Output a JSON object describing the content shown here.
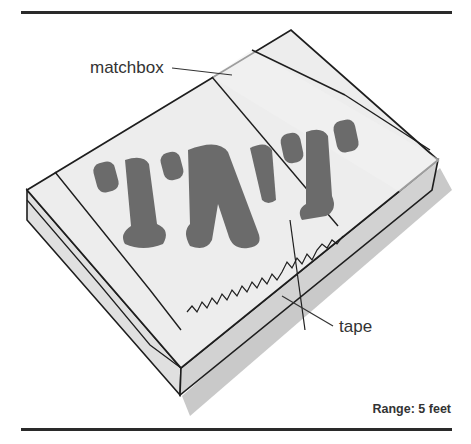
{
  "figure": {
    "labels": {
      "matchbox": "matchbox",
      "tape": "tape"
    },
    "range_text": "Range: 5 feet",
    "box_print": "'I'A'I'",
    "colors": {
      "rule": "#2a2a2a",
      "outline": "#1e1e1e",
      "top_face": "#ececec",
      "side_face": "#d4d4d4",
      "shadow": "#c8c8c8",
      "print": "#6b6b6b",
      "text": "#333333"
    }
  }
}
